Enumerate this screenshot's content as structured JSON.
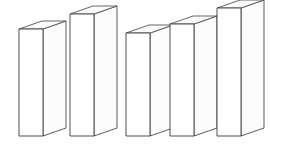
{
  "figure": {
    "title": "",
    "background_color": "#ffffff",
    "width": 290,
    "height": 145
  },
  "chart_data": {
    "type": "bar",
    "style": "3d-isometric-blocks",
    "title": "",
    "subtitle": "",
    "xlabel": "",
    "ylabel": "",
    "categories": [
      "1",
      "2",
      "3",
      "4",
      "5"
    ],
    "values": [
      99,
      114,
      95,
      104,
      120
    ],
    "ylim": [
      0,
      128
    ],
    "grid": false,
    "legend": null,
    "annotations": [],
    "tick_labels_x": [],
    "tick_labels_y": [],
    "series": [
      {
        "name": "series-1",
        "values": [
          99,
          114,
          95,
          104,
          120
        ]
      }
    ],
    "bar_color": "#ffffff",
    "edge_color": "#3a3a3a",
    "projection": {
      "depth_dx": 23,
      "depth_dy": -8,
      "bar_front_width": 24
    },
    "bars": [
      {
        "label": "1",
        "value": 99,
        "front_left_x": 19,
        "front_right_x": 43,
        "top_y": 29,
        "base_y": 136
      },
      {
        "label": "2",
        "value": 114,
        "front_left_x": 70,
        "front_right_x": 94,
        "top_y": 14,
        "base_y": 136
      },
      {
        "label": "3",
        "value": 95,
        "front_left_x": 126,
        "front_right_x": 150,
        "top_y": 33,
        "base_y": 136
      },
      {
        "label": "4",
        "value": 104,
        "front_left_x": 170,
        "front_right_x": 194,
        "top_y": 24,
        "base_y": 136
      },
      {
        "label": "5",
        "value": 120,
        "front_left_x": 217,
        "front_right_x": 241,
        "top_y": 8,
        "base_y": 136
      }
    ]
  }
}
